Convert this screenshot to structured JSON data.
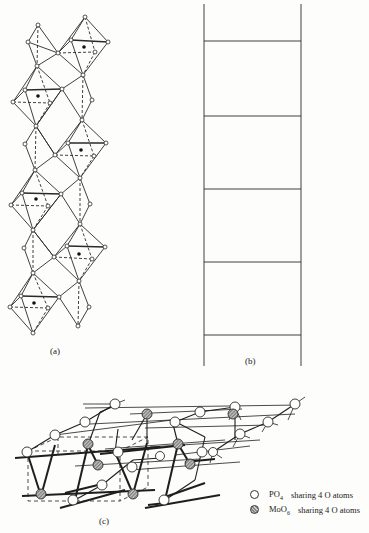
{
  "figure": {
    "panels": [
      {
        "id": "a",
        "label": "(a)",
        "description": "Chain of corner-sharing MoO6 octahedra and PO4 tetrahedra"
      },
      {
        "id": "b",
        "label": "(b)",
        "description": "Ladder schematic: two vertical rails with five rungs"
      },
      {
        "id": "c",
        "label": "(c)",
        "description": "3D framework of PO4 and MoO6 units with dashed unit cell"
      }
    ],
    "legend": [
      {
        "symbol": "open-circle",
        "formula": "PO",
        "subscript": "4",
        "text": "sharing 4 O atoms"
      },
      {
        "symbol": "hatched-circle",
        "formula": "MoO",
        "subscript": "6",
        "text": "sharing 4 O atoms"
      }
    ]
  },
  "colors": {
    "line": "#2a2a2a",
    "background": "#fdfdfb",
    "hatched_fill": "#9a9a9a"
  },
  "ladder": {
    "left_x": 204,
    "right_x": 301,
    "top_y": 4,
    "bottom_y": 366,
    "rungs_y": [
      41,
      116,
      189,
      262,
      335
    ]
  }
}
